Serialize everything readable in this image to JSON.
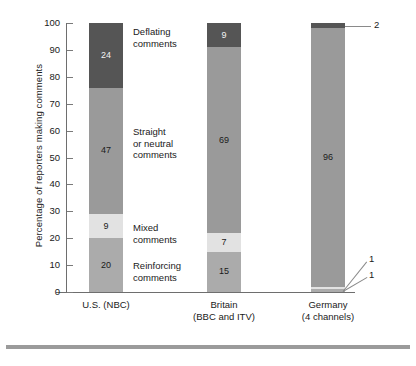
{
  "chart_data": {
    "type": "bar",
    "title": "",
    "subtitle": "",
    "xlabel": "",
    "ylabel": "Percentage of reporters making comments",
    "ylim": [
      0,
      100
    ],
    "yticks": [
      0,
      10,
      20,
      30,
      40,
      50,
      60,
      70,
      80,
      90,
      100
    ],
    "grid": false,
    "stacked": true,
    "stack_order_top_to_bottom": [
      "Deflating comments",
      "Straight or neutral comments",
      "Mixed comments",
      "Reinforcing comments"
    ],
    "categories": [
      "U.S. (NBC)",
      "Britain (BBC and ITV)",
      "Germany (4 channels)"
    ],
    "series": [
      {
        "name": "Deflating comments",
        "color": "#555555",
        "values": [
          24,
          9,
          2
        ]
      },
      {
        "name": "Straight or neutral comments",
        "color": "#9a9a9a",
        "values": [
          47,
          69,
          96
        ]
      },
      {
        "name": "Mixed comments",
        "color": "#e2e2e2",
        "values": [
          9,
          7,
          1
        ]
      },
      {
        "name": "Reinforcing comments",
        "color": "#ababab",
        "values": [
          20,
          15,
          1
        ]
      }
    ],
    "legend_position": "inline-between-bars",
    "annotations": [
      {
        "text": "2",
        "series": "Deflating comments",
        "category": "Germany (4 channels)",
        "leader": true
      },
      {
        "text": "1",
        "series": "Mixed comments",
        "category": "Germany (4 channels)",
        "leader": true
      },
      {
        "text": "1",
        "series": "Reinforcing comments",
        "category": "Germany (4 channels)",
        "leader": true
      }
    ]
  },
  "axis": {
    "y_title": "Percentage of reporters making comments",
    "y_ticks": [
      "100",
      "90",
      "80",
      "70",
      "60",
      "50",
      "40",
      "30",
      "20",
      "10",
      "0"
    ]
  },
  "categories_legend": [
    {
      "line1": "Deflating",
      "line2": "comments"
    },
    {
      "line1": "Straight",
      "line2": "or neutral",
      "line3": "comments"
    },
    {
      "line1": "Mixed",
      "line2": "comments"
    },
    {
      "line1": "Reinforcing",
      "line2": "comments"
    }
  ],
  "bars": [
    {
      "name": "us-nbc",
      "xlabel_line1": "U.S. (NBC)",
      "xlabel_line2": "",
      "segments": [
        {
          "label": "24",
          "value": 24,
          "shade": "dark"
        },
        {
          "label": "47",
          "value": 47,
          "shade": "mid"
        },
        {
          "label": "9",
          "value": 9,
          "shade": "light"
        },
        {
          "label": "20",
          "value": 20,
          "shade": "midlight"
        }
      ]
    },
    {
      "name": "britain",
      "xlabel_line1": "Britain",
      "xlabel_line2": "(BBC and ITV)",
      "segments": [
        {
          "label": "9",
          "value": 9,
          "shade": "dark"
        },
        {
          "label": "69",
          "value": 69,
          "shade": "mid"
        },
        {
          "label": "7",
          "value": 7,
          "shade": "light"
        },
        {
          "label": "15",
          "value": 15,
          "shade": "midlight"
        }
      ]
    },
    {
      "name": "germany",
      "xlabel_line1": "Germany",
      "xlabel_line2": "(4 channels)",
      "segments": [
        {
          "label": "",
          "value": 2,
          "shade": "dark"
        },
        {
          "label": "96",
          "value": 96,
          "shade": "mid"
        },
        {
          "label": "",
          "value": 1,
          "shade": "light"
        },
        {
          "label": "",
          "value": 1,
          "shade": "midlight"
        }
      ],
      "callouts": [
        {
          "text": "2"
        },
        {
          "text": "1"
        },
        {
          "text": "1"
        }
      ]
    }
  ],
  "colors": {
    "deflating": "#555555",
    "straight": "#9a9a9a",
    "mixed": "#e2e2e2",
    "reinforcing": "#ababab",
    "axis": "#6e6e6e",
    "rule": "#9b9b9b",
    "background": "#ffffff"
  }
}
